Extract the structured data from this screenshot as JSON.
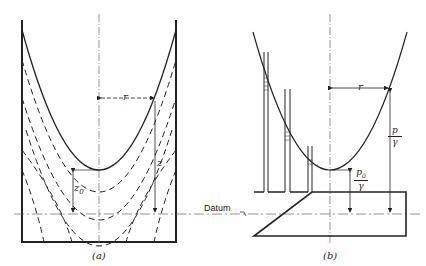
{
  "figure": {
    "panel_a": {
      "caption": "(a)",
      "labels": {
        "r": "r",
        "z": "z",
        "z0": "z",
        "z0_sub": "0"
      }
    },
    "panel_b": {
      "caption": "(b)",
      "labels": {
        "r": "r",
        "p_over_gamma_num": "p",
        "p_over_gamma_den": "γ",
        "p0_over_gamma_num": "p",
        "p0_sub": "0",
        "p0_over_gamma_den": "γ"
      }
    },
    "datum_label": "Datum",
    "colors": {
      "ink": "#222222",
      "background": "#ffffff",
      "centerline": "#555555"
    }
  }
}
